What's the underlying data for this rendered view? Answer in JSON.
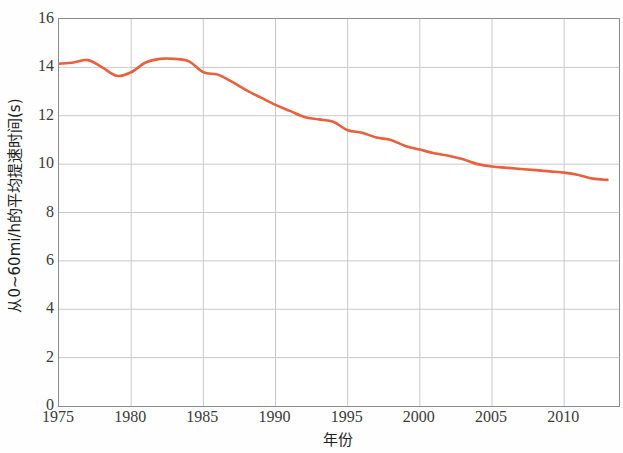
{
  "chart_data": {
    "type": "line",
    "title": "",
    "xlabel": "年份",
    "ylabel": "从0~60mi/h的平均提速时间(s)",
    "xlim": [
      1975,
      2013.8
    ],
    "ylim": [
      0,
      16
    ],
    "xticks": [
      1975,
      1980,
      1985,
      1990,
      1995,
      2000,
      2005,
      2010
    ],
    "xtick_labels": [
      "1975",
      "1980",
      "1985",
      "1990",
      "1995",
      "2000",
      "2005",
      "2010"
    ],
    "yticks": [
      0,
      2,
      4,
      6,
      8,
      10,
      12,
      14,
      16
    ],
    "ytick_labels": [
      "0",
      "2",
      "4",
      "6",
      "8",
      "10",
      "12",
      "14",
      "16"
    ],
    "grid": true,
    "legend": null,
    "line_color": "#E8603C",
    "line_width": 2.6,
    "series": [
      {
        "name": "从0~60mi/h的平均提速时间",
        "x": [
          1975.0,
          1976.0,
          1977.0,
          1978.0,
          1979.0,
          1980.0,
          1981.0,
          1982.0,
          1983.0,
          1984.0,
          1985.0,
          1986.0,
          1987.0,
          1988.0,
          1989.0,
          1990.0,
          1991.0,
          1992.0,
          1993.0,
          1994.0,
          1995.0,
          1996.0,
          1997.0,
          1998.0,
          1999.0,
          2000.0,
          2001.0,
          2002.0,
          2003.0,
          2004.0,
          2005.0,
          2006.0,
          2007.0,
          2008.0,
          2009.0,
          2010.0,
          2011.0,
          2012.0,
          2013.0
        ],
        "y": [
          14.15,
          14.2,
          14.3,
          14.0,
          13.65,
          13.8,
          14.2,
          14.35,
          14.35,
          14.25,
          13.8,
          13.7,
          13.4,
          13.05,
          12.75,
          12.45,
          12.2,
          11.95,
          11.85,
          11.75,
          11.4,
          11.3,
          11.1,
          11.0,
          10.75,
          10.6,
          10.45,
          10.35,
          10.2,
          10.0,
          9.9,
          9.85,
          9.8,
          9.75,
          9.7,
          9.65,
          9.55,
          9.4,
          9.35
        ]
      }
    ]
  },
  "axes": {
    "y_title": "从0~60mi/h的平均提速时间(s)",
    "x_title": "年份"
  }
}
